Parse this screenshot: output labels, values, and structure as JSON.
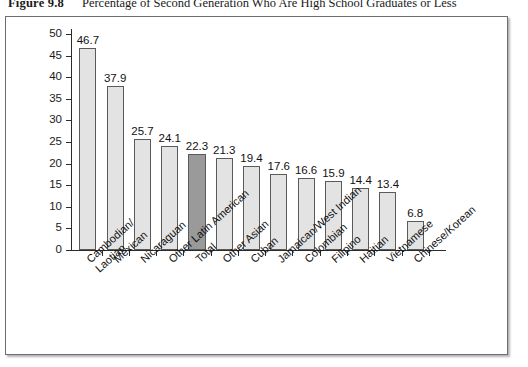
{
  "caption": {
    "figure_number": "Figure 9.8",
    "text": "Percentage of Second Generation Who Are High School Graduates or Less"
  },
  "colors": {
    "bar_fill": "#e3e3e3",
    "bar_highlight_fill": "#9a9a9a",
    "bar_border": "#5a5a5a",
    "axis": "#2b2b2b",
    "panel_border": "#6e6e6e",
    "background": "#ffffff"
  },
  "chart_data": {
    "type": "bar",
    "title": "Percentage of Second Generation Who Are High School Graduates or Less",
    "xlabel": "",
    "ylabel": "",
    "ylim": [
      0,
      50
    ],
    "ytick_step": 5,
    "yticks": [
      "0",
      "5",
      "10",
      "15",
      "20",
      "25",
      "30",
      "35",
      "40",
      "45",
      "50"
    ],
    "grid": false,
    "legend": "none",
    "highlight_category": "Total",
    "categories": [
      "Cambodian/\nLaotian",
      "Mexican",
      "Nicaraguan",
      "Other Latin American",
      "Total",
      "Other Asian",
      "Cuban",
      "Jamaican/West Indian",
      "Colombian",
      "Filipino",
      "Haitian",
      "Vietnamese",
      "Chinese/Korean"
    ],
    "values": [
      46.7,
      37.9,
      25.7,
      24.1,
      22.3,
      21.3,
      19.4,
      17.6,
      16.6,
      15.9,
      14.4,
      13.4,
      6.8
    ],
    "value_labels": [
      "46.7",
      "37.9",
      "25.7",
      "24.1",
      "22.3",
      "21.3",
      "19.4",
      "17.6",
      "16.6",
      "15.9",
      "14.4",
      "13.4",
      "6.8"
    ]
  }
}
